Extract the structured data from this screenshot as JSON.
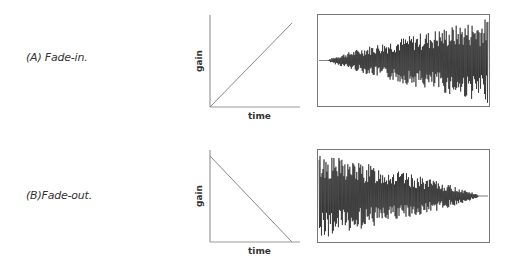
{
  "rows": [
    {
      "label": "(A) Fade-in.",
      "gain_plot": {
        "xlabel": "time",
        "ylabel": "gain",
        "shape": "ramp-up",
        "start_gain": 0,
        "end_gain": 1
      },
      "waveform": {
        "envelope": "increasing"
      }
    },
    {
      "label": "(B)Fade-out.",
      "gain_plot": {
        "xlabel": "time",
        "ylabel": "gain",
        "shape": "ramp-down",
        "start_gain": 1,
        "end_gain": 0
      },
      "waveform": {
        "envelope": "decreasing"
      }
    }
  ],
  "colors": {
    "axis": "#999999",
    "line": "#888888",
    "wave": "#111111",
    "frame": "#777777"
  }
}
